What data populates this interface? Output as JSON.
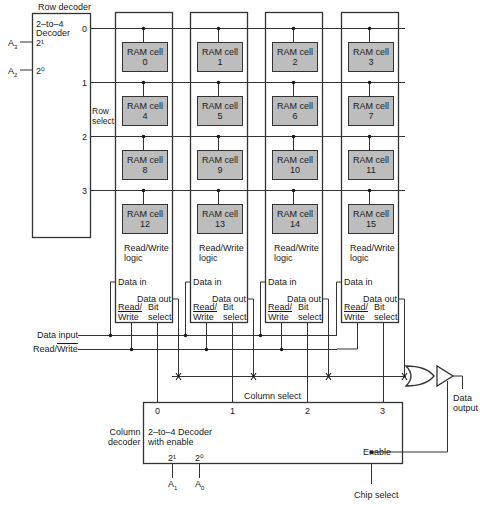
{
  "row_decoder": {
    "title": "Row decoder",
    "type_line1": "2–to–4",
    "type_line2": "Decoder",
    "inputs": [
      {
        "pin": "2¹",
        "signal": "A",
        "sub": "3"
      },
      {
        "pin": "2⁰",
        "signal": "A",
        "sub": "2"
      }
    ],
    "outputs": [
      "0",
      "1",
      "2",
      "3"
    ],
    "row_select_label1": "Row",
    "row_select_label2": "select"
  },
  "ram_cells": [
    {
      "label": "RAM cell",
      "index": "0"
    },
    {
      "label": "RAM cell",
      "index": "1"
    },
    {
      "label": "RAM cell",
      "index": "2"
    },
    {
      "label": "RAM cell",
      "index": "3"
    },
    {
      "label": "RAM cell",
      "index": "4"
    },
    {
      "label": "RAM cell",
      "index": "5"
    },
    {
      "label": "RAM cell",
      "index": "6"
    },
    {
      "label": "RAM cell",
      "index": "7"
    },
    {
      "label": "RAM cell",
      "index": "8"
    },
    {
      "label": "RAM cell",
      "index": "9"
    },
    {
      "label": "RAM cell",
      "index": "10"
    },
    {
      "label": "RAM cell",
      "index": "11"
    },
    {
      "label": "RAM cell",
      "index": "12"
    },
    {
      "label": "RAM cell",
      "index": "13"
    },
    {
      "label": "RAM cell",
      "index": "14"
    },
    {
      "label": "RAM cell",
      "index": "15"
    }
  ],
  "rw_logic": {
    "line1": "Read/Write",
    "line2": "logic",
    "data_in": "Data in",
    "data_out": "Data out",
    "rw_top": "Read/",
    "rw_bottom": "Write",
    "bit_top": "Bit",
    "bit_bottom": "select"
  },
  "buses": {
    "data_input": "Data input",
    "read_write_prefix": "Read/",
    "read_write_overline": "Write"
  },
  "column_select_label": "Column select",
  "column_decoder": {
    "label1": "Column",
    "label2": "decoder",
    "type_line1": "2–to–4 Decoder",
    "type_line2": "with enable",
    "outputs": [
      "0",
      "1",
      "2",
      "3"
    ],
    "inputs": [
      {
        "pin": "2¹",
        "signal": "A",
        "sub": "1"
      },
      {
        "pin": "2⁰",
        "signal": "A",
        "sub": "0"
      }
    ],
    "enable": "Enable"
  },
  "output": {
    "line1": "Data",
    "line2": "output"
  },
  "chip_select": "Chip select",
  "colors": {
    "line": "#333333",
    "cell_fill": "#bdbdbd",
    "background": "#ffffff"
  }
}
